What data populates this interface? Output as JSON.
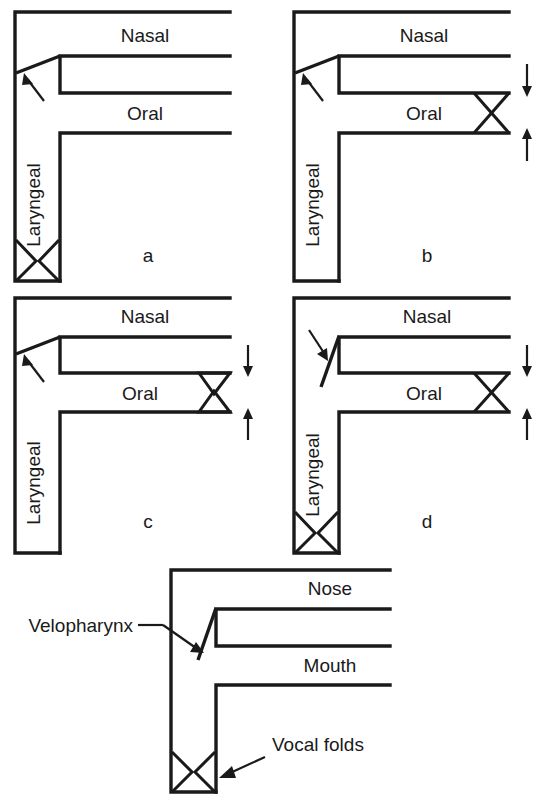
{
  "figure": {
    "stroke_color": "#1a1a1a",
    "background_color": "#ffffff"
  },
  "panels": [
    {
      "id": "a",
      "letter": "a",
      "labels": {
        "nasal": "Nasal",
        "oral": "Oral",
        "laryngeal": "Laryngeal"
      },
      "velum": "open",
      "oral_outlet": "open",
      "larynx": "closed-bowtie",
      "arrows": []
    },
    {
      "id": "b",
      "letter": "b",
      "labels": {
        "nasal": "Nasal",
        "oral": "Oral",
        "laryngeal": "Laryngeal"
      },
      "velum": "open",
      "oral_outlet": "closed-bowtie",
      "larynx": "open",
      "arrows": [
        "down",
        "up"
      ]
    },
    {
      "id": "c",
      "letter": "c",
      "labels": {
        "nasal": "Nasal",
        "oral": "Oral",
        "laryngeal": "Laryngeal"
      },
      "velum": "open",
      "oral_outlet": "narrow-triangles",
      "larynx": "open",
      "arrows": [
        "down",
        "up"
      ]
    },
    {
      "id": "d",
      "letter": "d",
      "labels": {
        "nasal": "Nasal",
        "oral": "Oral",
        "laryngeal": "Laryngeal"
      },
      "velum": "closed",
      "oral_outlet": "closed-bowtie",
      "larynx": "closed-bowtie",
      "arrows": [
        "down",
        "up"
      ]
    },
    {
      "id": "e",
      "letter": "",
      "labels": {
        "nose": "Nose",
        "mouth": "Mouth",
        "velopharynx": "Velopharynx",
        "vocal_folds": "Vocal folds"
      },
      "velum": "closed",
      "oral_outlet": "open",
      "larynx": "closed-bowtie",
      "arrows": []
    }
  ],
  "callouts": {
    "velopharynx": "Velopharynx",
    "vocal_folds": "Vocal folds"
  }
}
